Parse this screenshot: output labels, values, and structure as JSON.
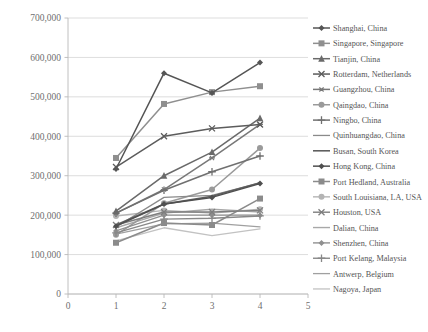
{
  "chart_data": {
    "type": "line",
    "title": "",
    "subtitle": "",
    "xlabel": "",
    "ylabel": "",
    "xlim": [
      0,
      5
    ],
    "ylim": [
      0,
      700000
    ],
    "xticks": [
      "0",
      "1",
      "2",
      "3",
      "4",
      "5"
    ],
    "yticks": [
      "0",
      "100,000",
      "200,000",
      "300,000",
      "400,000",
      "500,000",
      "600,000",
      "700,000"
    ],
    "ytick_values": [
      0,
      100000,
      200000,
      300000,
      400000,
      500000,
      600000,
      700000
    ],
    "x": [
      1,
      2,
      3,
      4
    ],
    "grid": "horizontal",
    "legend_position": "right",
    "series": [
      {
        "name": "Shanghai, China",
        "marker": "diamond",
        "color": "#555555",
        "width": 1.5,
        "values": [
          317000,
          560000,
          510000,
          587000
        ]
      },
      {
        "name": "Singapore, Singapore",
        "marker": "square",
        "color": "#8f8f8f",
        "width": 1.5,
        "values": [
          345000,
          482000,
          512000,
          527000
        ]
      },
      {
        "name": "Tianjin, China",
        "marker": "triangle",
        "color": "#6a6a6a",
        "width": 1.5,
        "values": [
          210000,
          300000,
          360000,
          446000
        ]
      },
      {
        "name": "Rotterdam, Netherlands",
        "marker": "x",
        "color": "#5c5c5c",
        "width": 1.5,
        "values": [
          322000,
          400000,
          420000,
          430000
        ]
      },
      {
        "name": "Guangzhou, China",
        "marker": "star",
        "color": "#787878",
        "width": 1.5,
        "values": [
          205000,
          265000,
          345000,
          430000
        ]
      },
      {
        "name": "Qaingdao, China",
        "marker": "circle",
        "color": "#9a9a9a",
        "width": 1.5,
        "values": [
          150000,
          230000,
          265000,
          370000
        ]
      },
      {
        "name": "Ningbo, China",
        "marker": "plus",
        "color": "#707070",
        "width": 1.5,
        "values": [
          205000,
          263000,
          310000,
          350000
        ]
      },
      {
        "name": "Quinhuangdao, China",
        "marker": "none",
        "color": "#8a8a8a",
        "width": 1.3,
        "values": [
          170000,
          245000,
          250000,
          282000
        ]
      },
      {
        "name": "Busan, South Korea",
        "marker": "none",
        "color": "#5f5f5f",
        "width": 1.6,
        "values": [
          175000,
          228000,
          248000,
          282000
        ]
      },
      {
        "name": "Hong Kong, China",
        "marker": "diamond",
        "color": "#4f4f4f",
        "width": 1.5,
        "values": [
          172000,
          228000,
          245000,
          280000
        ]
      },
      {
        "name": "Port Hedland, Australia",
        "marker": "square",
        "color": "#8b8b8b",
        "width": 1.5,
        "values": [
          130000,
          180000,
          175000,
          242000
        ]
      },
      {
        "name": "South Louisiana, LA, USA",
        "marker": "circle",
        "color": "#b4b4b4",
        "width": 1.4,
        "values": [
          198000,
          212000,
          205000,
          215000
        ]
      },
      {
        "name": "Houston, USA",
        "marker": "x",
        "color": "#7e7e7e",
        "width": 1.4,
        "values": [
          175000,
          208000,
          208000,
          212000
        ]
      },
      {
        "name": "Dalian, China",
        "marker": "none",
        "color": "#a8a8a8",
        "width": 1.4,
        "values": [
          168000,
          205000,
          215000,
          208000
        ]
      },
      {
        "name": "Shenzhen, China",
        "marker": "diamond",
        "color": "#909090",
        "width": 1.4,
        "values": [
          160000,
          200000,
          200000,
          200000
        ]
      },
      {
        "name": "Port Kelang, Malaysia",
        "marker": "plus",
        "color": "#888888",
        "width": 1.4,
        "values": [
          155000,
          190000,
          192000,
          198000
        ]
      },
      {
        "name": "Antwerp, Belgium",
        "marker": "none",
        "color": "#a0a0a0",
        "width": 1.3,
        "values": [
          152000,
          178000,
          180000,
          170000
        ]
      },
      {
        "name": "Nagoya, Japan",
        "marker": "none",
        "color": "#c2c2c2",
        "width": 1.3,
        "values": [
          135000,
          168000,
          148000,
          165000
        ]
      }
    ]
  },
  "colors": {
    "background": "#ffffff",
    "grid": "#d4d4d4",
    "axis": "#b9b9b9",
    "tick_text": "#6f6f6f",
    "legend_text": "#555555"
  }
}
